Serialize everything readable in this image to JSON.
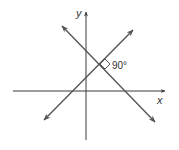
{
  "diagram": {
    "type": "coordinate-plane-perpendicular-lines",
    "axes": {
      "x_label": "x",
      "y_label": "y"
    },
    "angle_label": "90°",
    "colors": {
      "axis": "#3a3a3a",
      "line": "#555555",
      "text": "#333333",
      "background": "#ffffff"
    },
    "elements": [
      {
        "name": "x-axis",
        "kind": "axis",
        "from": [
          13,
          91
        ],
        "to": [
          165,
          91
        ],
        "arrow": "end"
      },
      {
        "name": "y-axis",
        "kind": "axis",
        "from": [
          86,
          140
        ],
        "to": [
          86,
          12
        ],
        "arrow": "end"
      },
      {
        "name": "line-descending",
        "kind": "line",
        "from": [
          62,
          26
        ],
        "to": [
          155,
          122
        ],
        "arrow": "both"
      },
      {
        "name": "line-ascending",
        "kind": "line",
        "from": [
          44,
          120
        ],
        "to": [
          133,
          30
        ],
        "arrow": "both"
      }
    ],
    "intersection": [
      100,
      64
    ]
  }
}
